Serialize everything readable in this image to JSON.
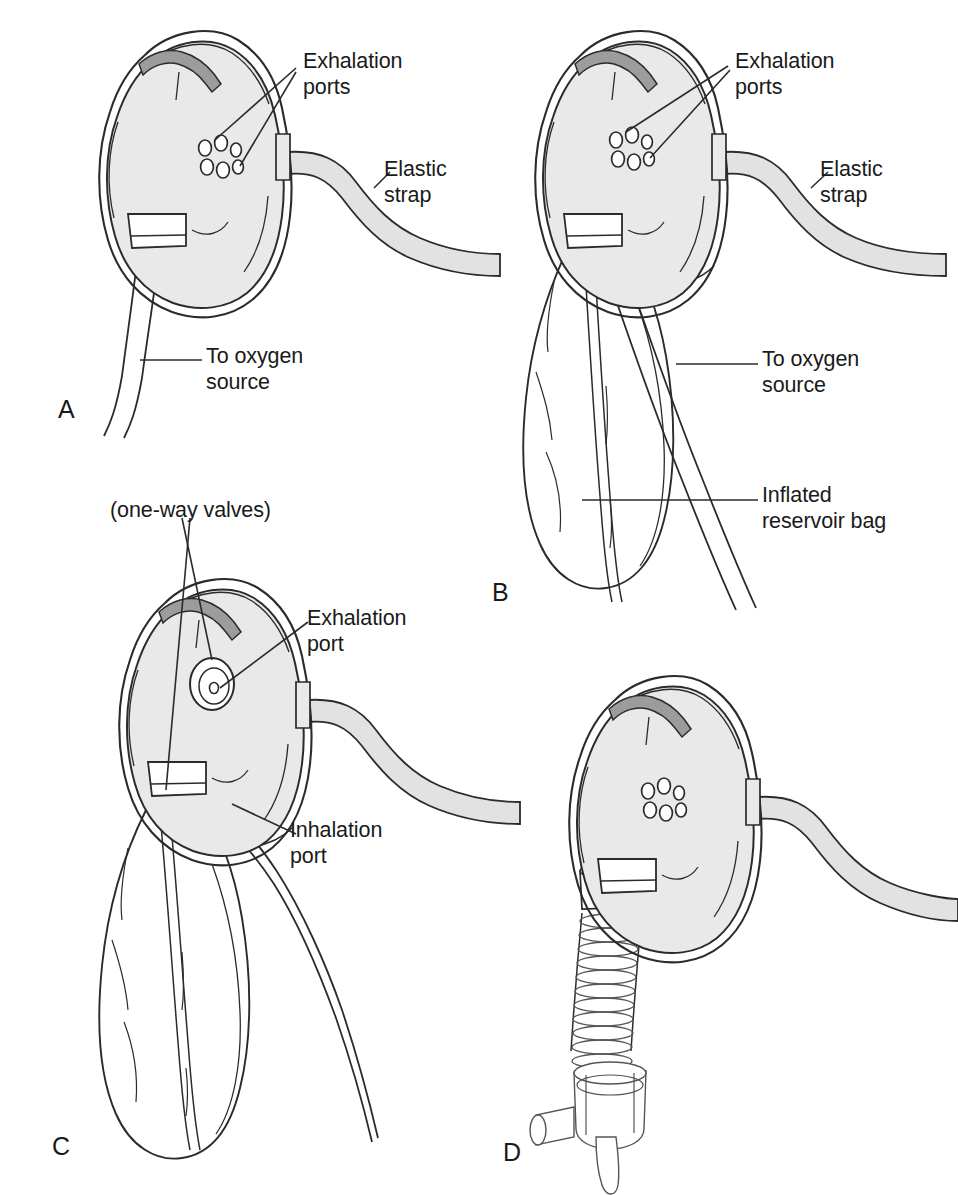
{
  "figure": {
    "background_color": "#ffffff",
    "line_color": "#2b2b2b",
    "mask_fill": "#e9e9e9",
    "mask_fill_dark": "#dcdcdc",
    "noseclip_fill": "#9c9c9c",
    "strap_fill": "#e2e2e2",
    "valve_band_fill": "#111111",
    "text_color": "#1a1a1a"
  },
  "panels": [
    {
      "id": "A",
      "letter": "A",
      "name": "simple-oxygen-mask",
      "letter_pos": {
        "x": 58,
        "y": 395
      },
      "labels": [
        {
          "key": "exhalation_ports",
          "text": "Exhalation\nports",
          "x": 303,
          "y": 55
        },
        {
          "key": "elastic_strap",
          "text": "Elastic\nstrap",
          "x": 384,
          "y": 163
        },
        {
          "key": "to_oxygen_source",
          "text": "To oxygen\nsource",
          "x": 206,
          "y": 350
        }
      ]
    },
    {
      "id": "B",
      "letter": "B",
      "name": "partial-rebreather-mask",
      "letter_pos": {
        "x": 492,
        "y": 578
      },
      "labels": [
        {
          "key": "exhalation_ports",
          "text": "Exhalation\nports",
          "x": 735,
          "y": 55
        },
        {
          "key": "elastic_strap",
          "text": "Elastic\nstrap",
          "x": 820,
          "y": 163
        },
        {
          "key": "to_oxygen_source",
          "text": "To oxygen\nsource",
          "x": 762,
          "y": 353
        },
        {
          "key": "inflated_reservoir_bag",
          "text": "Inflated\nreservoir bag",
          "x": 762,
          "y": 487
        }
      ]
    },
    {
      "id": "C",
      "letter": "C",
      "name": "nonrebreather-mask",
      "letter_pos": {
        "x": 52,
        "y": 1132
      },
      "labels": [
        {
          "key": "one_way_valves",
          "text": "(one-way valves)",
          "x": 110,
          "y": 502
        },
        {
          "key": "exhalation_port",
          "text": "Exhalation\nport",
          "x": 307,
          "y": 612
        },
        {
          "key": "inhalation_port",
          "text": "Inhalation\nport",
          "x": 290,
          "y": 824
        }
      ]
    },
    {
      "id": "D",
      "letter": "D",
      "name": "venturi-mask",
      "letter_pos": {
        "x": 503,
        "y": 1138
      },
      "labels": []
    }
  ],
  "components": {
    "mask_body": "mask-body",
    "nose_clip": "nose-clip",
    "exhalation_port_cluster": "exhalation-port-cluster",
    "exhalation_valve_disc": "exhalation-valve-disc",
    "elastic_strap": "elastic-strap",
    "oxygen_tubing": "oxygen-tubing",
    "reservoir_bag": "reservoir-bag",
    "one_way_valve_band": "one-way-valve-band",
    "corrugated_tubing": "corrugated-tubing",
    "venturi_adapter": "venturi-adapter"
  }
}
